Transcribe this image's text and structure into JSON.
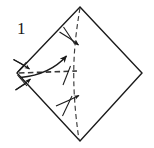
{
  "figure": {
    "kind": "origami-fold-diagram",
    "step_label": "1",
    "background_color": "#ffffff",
    "ink_color": "#1a1a1a",
    "canvas": {
      "width": 154,
      "height": 148
    },
    "paper": {
      "name": "square-sheet-rotated-45",
      "shape": "diamond",
      "stroke_color": "#1a1a1a",
      "stroke_width": 1.3,
      "fill": "#ffffff",
      "vertices": {
        "top": [
          80,
          7
        ],
        "right": [
          142,
          73
        ],
        "bottom": [
          80,
          141
        ],
        "left": [
          17,
          73
        ]
      }
    },
    "creases": [
      {
        "name": "vertical-crease",
        "style": "dashed",
        "from": [
          80,
          7
        ],
        "to": [
          80,
          141
        ],
        "dash": "5,3"
      },
      {
        "name": "horizontal-crease",
        "style": "dashed",
        "from": [
          17,
          73
        ],
        "to": [
          76,
          71
        ],
        "dash": "5,3"
      }
    ],
    "arrows": [
      {
        "name": "fold-arrow-upper",
        "style": "solid-short",
        "from": [
          59,
          31
        ],
        "to": [
          79,
          45
        ],
        "note": "small arrow crossing the vertical crease, upper"
      },
      {
        "name": "fold-arrow-lower",
        "style": "solid-short",
        "from": [
          56,
          105
        ],
        "to": [
          80,
          95
        ],
        "note": "small arrow crossing the vertical crease, lower"
      },
      {
        "name": "main-fold-arrow",
        "style": "solid-curved",
        "from": [
          20,
          76
        ],
        "to": [
          67,
          55
        ],
        "note": "long curved arrow sweeping up-right from left vertex"
      },
      {
        "name": "unfold-arrow-top-left",
        "style": "solid-short",
        "from": [
          14,
          59
        ],
        "to": [
          30,
          69
        ],
        "note": "small arrow pointing in toward left vertex from above"
      },
      {
        "name": "unfold-arrow-bottom-left",
        "style": "solid-short",
        "from": [
          16,
          89
        ],
        "to": [
          31,
          79
        ],
        "note": "small arrow pointing in toward left vertex from below"
      }
    ],
    "tick_marks": [
      {
        "name": "crease-tick-upper",
        "from": [
          64,
          27
        ],
        "to": [
          74,
          43
        ]
      },
      {
        "name": "crease-tick-lower",
        "from": [
          63,
          115
        ],
        "to": [
          72,
          97
        ]
      },
      {
        "name": "crease-tick-center",
        "from": [
          63,
          84
        ],
        "to": [
          70,
          67
        ]
      }
    ]
  }
}
